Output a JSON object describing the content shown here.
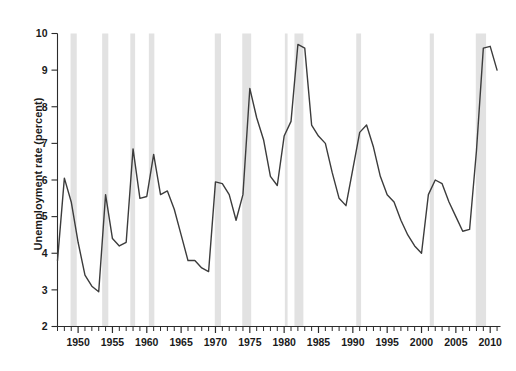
{
  "chart_data": {
    "type": "line",
    "title": "",
    "xlabel": "",
    "ylabel": "Unemployment rate (percent)",
    "xlim": [
      1947,
      2011.5
    ],
    "ylim": [
      2,
      10
    ],
    "yticks": [
      2,
      3,
      4,
      5,
      6,
      7,
      8,
      9,
      10
    ],
    "ytick_labels": [
      "2",
      "3",
      "4",
      "5",
      "6",
      "7",
      "8",
      "9",
      "10"
    ],
    "xticks": [
      1950,
      1955,
      1960,
      1965,
      1970,
      1975,
      1980,
      1985,
      1990,
      1995,
      2000,
      2005,
      2010
    ],
    "xtick_labels": [
      "1950",
      "1955",
      "1960",
      "1965",
      "1970",
      "1975",
      "1980",
      "1985",
      "1990",
      "1995",
      "2000",
      "2005",
      "2010"
    ],
    "xtick_minor_step": 1,
    "grid": false,
    "legend": null,
    "line_color": "#3c3c3c",
    "line_width": 1.4,
    "band_color": "#e2e2e2",
    "axis_color": "#2b2b2b",
    "series": [
      {
        "name": "Unemployment rate",
        "x": [
          1947,
          1948,
          1949,
          1950,
          1951,
          1952,
          1953,
          1954,
          1955,
          1956,
          1957,
          1958,
          1959,
          1960,
          1961,
          1962,
          1963,
          1964,
          1965,
          1966,
          1967,
          1968,
          1969,
          1970,
          1971,
          1972,
          1973,
          1974,
          1975,
          1976,
          1977,
          1978,
          1979,
          1980,
          1981,
          1982,
          1983,
          1984,
          1985,
          1986,
          1987,
          1988,
          1989,
          1990,
          1991,
          1992,
          1993,
          1994,
          1995,
          1996,
          1997,
          1998,
          1999,
          2000,
          2001,
          2002,
          2003,
          2004,
          2005,
          2006,
          2007,
          2008,
          2009,
          2010,
          2011
        ],
        "values": [
          3.8,
          6.05,
          5.4,
          4.3,
          3.4,
          3.1,
          2.95,
          5.6,
          4.4,
          4.2,
          4.3,
          6.85,
          5.5,
          5.55,
          6.7,
          5.6,
          5.7,
          5.2,
          4.5,
          3.8,
          3.8,
          3.6,
          3.5,
          5.95,
          5.9,
          5.6,
          4.9,
          5.6,
          8.5,
          7.7,
          7.1,
          6.1,
          5.85,
          7.2,
          7.6,
          9.7,
          9.6,
          7.5,
          7.2,
          7.0,
          6.2,
          5.5,
          5.3,
          6.3,
          7.3,
          7.5,
          6.9,
          6.1,
          5.6,
          5.4,
          4.9,
          4.5,
          4.2,
          4.0,
          5.6,
          6.0,
          5.9,
          5.4,
          5.0,
          4.6,
          4.65,
          6.8,
          9.6,
          9.65,
          9.0
        ]
      }
    ],
    "recession_bands": [
      {
        "start": 1948.9,
        "end": 1949.8
      },
      {
        "start": 1953.5,
        "end": 1954.4
      },
      {
        "start": 1957.6,
        "end": 1958.3
      },
      {
        "start": 1960.3,
        "end": 1961.1
      },
      {
        "start": 1969.9,
        "end": 1970.8
      },
      {
        "start": 1973.9,
        "end": 1975.2
      },
      {
        "start": 1980.1,
        "end": 1980.5
      },
      {
        "start": 1981.5,
        "end": 1982.8
      },
      {
        "start": 1990.5,
        "end": 1991.2
      },
      {
        "start": 2001.2,
        "end": 2001.8
      },
      {
        "start": 2007.9,
        "end": 2009.4
      }
    ]
  }
}
